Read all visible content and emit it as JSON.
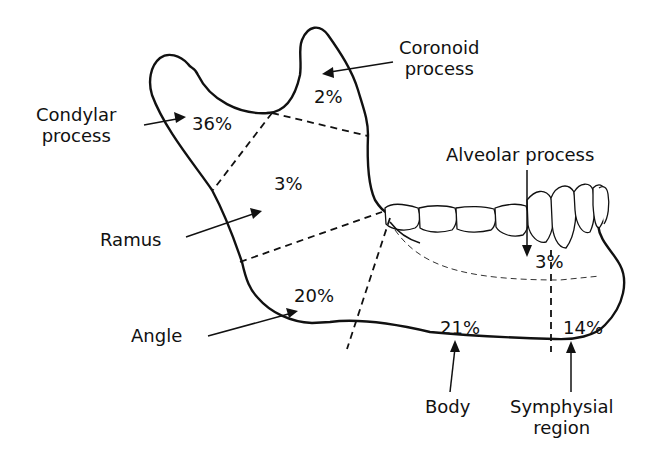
{
  "diagram": {
    "colors": {
      "ink": "#111111",
      "background": "#ffffff"
    },
    "regions": [
      {
        "id": "condylar",
        "label_line1": "Condylar",
        "label_line2": "process",
        "percent": "36%"
      },
      {
        "id": "coronoid",
        "label_line1": "Coronoid",
        "label_line2": "process",
        "percent": "2%"
      },
      {
        "id": "ramus",
        "label_line1": "Ramus",
        "label_line2": "",
        "percent": "3%"
      },
      {
        "id": "angle",
        "label_line1": "Angle",
        "label_line2": "",
        "percent": "20%"
      },
      {
        "id": "alveolar",
        "label_line1": "Alveolar process",
        "label_line2": "",
        "percent": "3%"
      },
      {
        "id": "body",
        "label_line1": "Body",
        "label_line2": "",
        "percent": "21%"
      },
      {
        "id": "symphysial",
        "label_line1": "Symphysial",
        "label_line2": "region",
        "percent": "14%"
      }
    ]
  }
}
